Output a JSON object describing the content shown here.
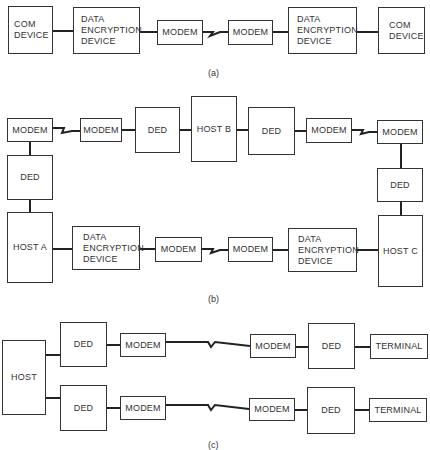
{
  "diagram_a": {
    "caption": "(a)",
    "boxes": [
      {
        "id": "a1",
        "label": "COM\nDEVICE"
      },
      {
        "id": "a2",
        "label": "DATA\nENCRYPTION\nDEVICE"
      },
      {
        "id": "a3",
        "label": "MODEM"
      },
      {
        "id": "a4",
        "label": "MODEM"
      },
      {
        "id": "a5",
        "label": "DATA\nENCRYPTION\nDEVICE"
      },
      {
        "id": "a6",
        "label": "COM\nDEVICE"
      }
    ]
  },
  "diagram_b": {
    "caption": "(b)",
    "boxes": [
      {
        "id": "b_modem_tl",
        "label": "MODEM"
      },
      {
        "id": "b_modem_t2",
        "label": "MODEM"
      },
      {
        "id": "b_ded_t1",
        "label": "DED"
      },
      {
        "id": "b_host_b",
        "label": "HOST B"
      },
      {
        "id": "b_ded_t2",
        "label": "DED"
      },
      {
        "id": "b_modem_t3",
        "label": "MODEM"
      },
      {
        "id": "b_modem_tr",
        "label": "MODEM"
      },
      {
        "id": "b_ded_l",
        "label": "DED"
      },
      {
        "id": "b_host_a",
        "label": "HOST A"
      },
      {
        "id": "b_dataenc_bl",
        "label": "DATA\nENCRYPTION\nDEVICE"
      },
      {
        "id": "b_modem_b1",
        "label": "MODEM"
      },
      {
        "id": "b_modem_b2",
        "label": "MODEM"
      },
      {
        "id": "b_dataenc_br",
        "label": "DATA\nENCRYPTION\nDEVICE"
      },
      {
        "id": "b_host_c",
        "label": "HOST C"
      },
      {
        "id": "b_ded_r",
        "label": "DED"
      }
    ]
  },
  "diagram_c": {
    "caption": "(c)",
    "boxes": [
      {
        "id": "c_host",
        "label": "HOST"
      },
      {
        "id": "c_ded_1",
        "label": "DED"
      },
      {
        "id": "c_modem_1",
        "label": "MODEM"
      },
      {
        "id": "c_modem_2",
        "label": "MODEM"
      },
      {
        "id": "c_ded_2",
        "label": "DED"
      },
      {
        "id": "c_terminal_1",
        "label": "TERMINAL"
      },
      {
        "id": "c_ded_3",
        "label": "DED"
      },
      {
        "id": "c_modem_3",
        "label": "MODEM"
      },
      {
        "id": "c_modem_4",
        "label": "MODEM"
      },
      {
        "id": "c_ded_4",
        "label": "DED"
      },
      {
        "id": "c_terminal_2",
        "label": "TERMINAL"
      }
    ]
  },
  "colors": {
    "stroke": "#222222",
    "box_border": "#333333",
    "text": "#333333",
    "background": "#ffffff"
  }
}
